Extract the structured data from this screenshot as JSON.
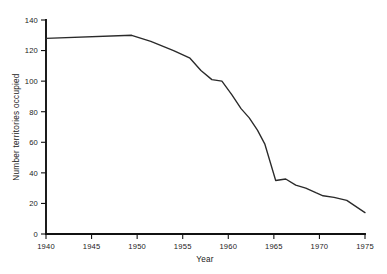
{
  "chart_data": {
    "type": "line",
    "title": "",
    "subtitle": "",
    "xlabel": "Year",
    "ylabel": "Number territories occupied",
    "xlim": [
      1940,
      1975
    ],
    "ylim": [
      0,
      140
    ],
    "grid": false,
    "legend": "none",
    "x_ticks": [
      "1940",
      "1945",
      "1950",
      "1955",
      "1960",
      "1965",
      "1970",
      "1975"
    ],
    "x_tick_values": [
      1940,
      1945,
      1950,
      1955,
      1960,
      1965,
      1970,
      1975
    ],
    "y_ticks": [
      "0",
      "20",
      "40",
      "60",
      "80",
      "100",
      "120",
      "140"
    ],
    "y_tick_values": [
      0,
      20,
      40,
      60,
      80,
      100,
      120,
      140
    ],
    "series": [
      {
        "name": "Territories occupied",
        "color": "#2a2a2a",
        "x": [
          1940,
          1949.4,
          1951.5,
          1954.0,
          1955.8,
          1957.0,
          1958.2,
          1959.3,
          1960.4,
          1961.4,
          1962.3,
          1963.2,
          1964.0,
          1965.2,
          1966.3,
          1967.4,
          1968.5,
          1969.6,
          1970.4,
          1971.6,
          1973.0,
          1975.0
        ],
        "y": [
          128,
          130,
          126,
          120,
          115,
          107,
          101,
          100,
          91,
          82,
          76,
          68,
          59,
          35,
          36,
          32,
          30,
          27,
          25,
          24,
          22,
          14
        ]
      }
    ],
    "annotations": []
  },
  "axis": {
    "y_label": "Number territories occupied",
    "x_label": "Year"
  }
}
